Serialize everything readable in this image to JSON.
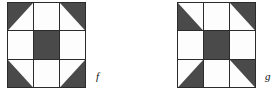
{
  "figure": {
    "type": "quilt-block-diagram",
    "background_color": "#ffffff",
    "dark_color": "#4a4a4a",
    "light_color": "#fdfdfd",
    "line_color": "#2b2b2b",
    "blocks": [
      {
        "id": "block-f",
        "label": "f",
        "grid_size": 3,
        "x": 7,
        "y": 2,
        "width": 79,
        "height": 86,
        "label_x": 96,
        "label_y": 71,
        "cells": [
          {
            "row": 0,
            "col": 0,
            "name": "top-left-cell",
            "fill": "half-dark",
            "dark_corner": "top-left"
          },
          {
            "row": 0,
            "col": 1,
            "name": "top-center-cell",
            "fill": "light",
            "dark_corner": "none"
          },
          {
            "row": 0,
            "col": 2,
            "name": "top-right-cell",
            "fill": "half-dark",
            "dark_corner": "top-right"
          },
          {
            "row": 1,
            "col": 0,
            "name": "middle-left-cell",
            "fill": "light",
            "dark_corner": "none"
          },
          {
            "row": 1,
            "col": 1,
            "name": "center-cell",
            "fill": "dark",
            "dark_corner": "all"
          },
          {
            "row": 1,
            "col": 2,
            "name": "middle-right-cell",
            "fill": "light",
            "dark_corner": "none"
          },
          {
            "row": 2,
            "col": 0,
            "name": "bottom-left-cell",
            "fill": "half-dark",
            "dark_corner": "bottom-left"
          },
          {
            "row": 2,
            "col": 1,
            "name": "bottom-center-cell",
            "fill": "light",
            "dark_corner": "none"
          },
          {
            "row": 2,
            "col": 2,
            "name": "bottom-right-cell",
            "fill": "half-dark",
            "dark_corner": "bottom-right"
          }
        ]
      },
      {
        "id": "block-g",
        "label": "g",
        "grid_size": 3,
        "x": 177,
        "y": 2,
        "width": 79,
        "height": 86,
        "label_x": 265,
        "label_y": 71,
        "cells": [
          {
            "row": 0,
            "col": 0,
            "name": "top-left-cell",
            "fill": "half-dark",
            "dark_corner": "bottom-left"
          },
          {
            "row": 0,
            "col": 1,
            "name": "top-center-cell",
            "fill": "light",
            "dark_corner": "none"
          },
          {
            "row": 0,
            "col": 2,
            "name": "top-right-cell",
            "fill": "half-dark",
            "dark_corner": "top-right"
          },
          {
            "row": 1,
            "col": 0,
            "name": "middle-left-cell",
            "fill": "light",
            "dark_corner": "none"
          },
          {
            "row": 1,
            "col": 1,
            "name": "center-cell",
            "fill": "dark",
            "dark_corner": "all"
          },
          {
            "row": 1,
            "col": 2,
            "name": "middle-right-cell",
            "fill": "light",
            "dark_corner": "none"
          },
          {
            "row": 2,
            "col": 0,
            "name": "bottom-left-cell",
            "fill": "half-dark",
            "dark_corner": "bottom-right"
          },
          {
            "row": 2,
            "col": 1,
            "name": "bottom-center-cell",
            "fill": "light",
            "dark_corner": "none"
          },
          {
            "row": 2,
            "col": 2,
            "name": "bottom-right-cell",
            "fill": "half-dark",
            "dark_corner": "top-right"
          }
        ]
      }
    ]
  }
}
